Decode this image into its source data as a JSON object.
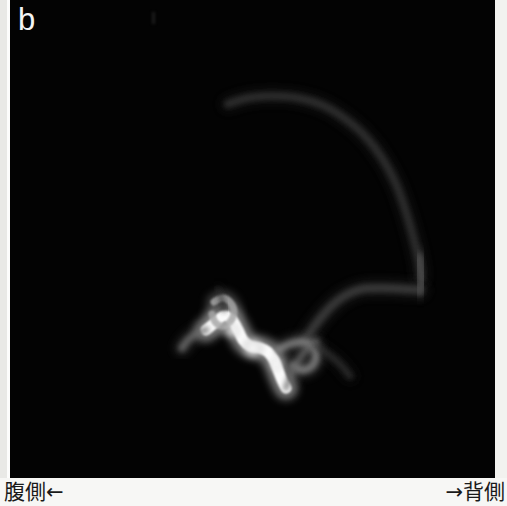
{
  "figure": {
    "panel_label": "b",
    "background_color": "#030303",
    "caption_background_color": "#f7f7f5"
  },
  "caption": {
    "left_label": "腹側←",
    "right_label": "→背側"
  },
  "chart_data": {
    "type": "scatter",
    "title": "b",
    "subtitle": "",
    "xlabel": "腹側← → 背側",
    "ylabel": "",
    "legend_position": "none",
    "grid": false,
    "modality": "MR angiography maximum intensity projection",
    "orientation": {
      "left_direction_label": "腹側←",
      "left_direction_meaning": "ventral",
      "right_direction_label": "→背側",
      "right_direction_meaning": "dorsal"
    },
    "xlim": [
      0,
      485
    ],
    "ylim": [
      0,
      478
    ],
    "annotations": [
      {
        "text": "b",
        "x": 18,
        "y": 22,
        "color": "#f4f4f4"
      }
    ],
    "series": [
      {
        "name": "cortical-arc-vessel",
        "intensity": 0.22,
        "stroke_width": 7,
        "points": [
          [
            218,
            104
          ],
          [
            238,
            98
          ],
          [
            262,
            96
          ],
          [
            288,
            98
          ],
          [
            312,
            105
          ],
          [
            334,
            118
          ],
          [
            355,
            136
          ],
          [
            372,
            158
          ],
          [
            386,
            184
          ],
          [
            396,
            212
          ],
          [
            404,
            240
          ],
          [
            409,
            262
          ],
          [
            411,
            278
          ]
        ]
      },
      {
        "name": "descending-limb-vessel",
        "intensity": 0.3,
        "stroke_width": 9,
        "points": [
          [
            409,
            258
          ],
          [
            411,
            272
          ],
          [
            412,
            282
          ],
          [
            410,
            290
          ]
        ]
      },
      {
        "name": "horizontal-basal-segment",
        "intensity": 0.26,
        "stroke_width": 8,
        "points": [
          [
            410,
            290
          ],
          [
            392,
            289
          ],
          [
            372,
            288
          ],
          [
            352,
            289
          ],
          [
            338,
            294
          ],
          [
            326,
            302
          ],
          [
            314,
            314
          ],
          [
            303,
            328
          ],
          [
            294,
            342
          ]
        ]
      },
      {
        "name": "bright-tortuous-cluster-main",
        "intensity": 0.95,
        "stroke_width": 11,
        "points": [
          [
            196,
            330
          ],
          [
            206,
            322
          ],
          [
            214,
            316
          ],
          [
            222,
            320
          ],
          [
            228,
            330
          ],
          [
            233,
            340
          ],
          [
            240,
            346
          ],
          [
            250,
            348
          ],
          [
            258,
            352
          ],
          [
            264,
            360
          ],
          [
            268,
            370
          ],
          [
            272,
            380
          ],
          [
            276,
            388
          ]
        ]
      },
      {
        "name": "upper-loop-branch",
        "intensity": 0.62,
        "stroke_width": 7,
        "points": [
          [
            204,
            302
          ],
          [
            212,
            298
          ],
          [
            220,
            302
          ],
          [
            224,
            312
          ],
          [
            220,
            322
          ],
          [
            212,
            326
          ],
          [
            205,
            322
          ],
          [
            202,
            314
          ]
        ]
      },
      {
        "name": "left-tail-branch",
        "intensity": 0.42,
        "stroke_width": 7,
        "points": [
          [
            196,
            330
          ],
          [
            186,
            334
          ],
          [
            178,
            340
          ],
          [
            172,
            348
          ]
        ]
      },
      {
        "name": "right-hook-branch",
        "intensity": 0.5,
        "stroke_width": 7,
        "points": [
          [
            268,
            350
          ],
          [
            280,
            344
          ],
          [
            292,
            342
          ],
          [
            302,
            346
          ],
          [
            306,
            356
          ],
          [
            302,
            366
          ],
          [
            292,
            370
          ],
          [
            284,
            366
          ]
        ]
      },
      {
        "name": "lower-descending-branch",
        "intensity": 0.38,
        "stroke_width": 6,
        "points": [
          [
            276,
            388
          ],
          [
            282,
            372
          ],
          [
            290,
            358
          ],
          [
            298,
            348
          ],
          [
            306,
            342
          ]
        ]
      },
      {
        "name": "faint-distal-wisp",
        "intensity": 0.2,
        "stroke_width": 6,
        "points": [
          [
            306,
            346
          ],
          [
            318,
            354
          ],
          [
            330,
            364
          ],
          [
            340,
            376
          ]
        ]
      },
      {
        "name": "faint-upper-left-wisp",
        "intensity": 0.16,
        "stroke_width": 5,
        "points": [
          [
            208,
            290
          ],
          [
            212,
            300
          ],
          [
            214,
            310
          ]
        ]
      }
    ],
    "hotspots": [
      {
        "name": "brightest-node",
        "x": 243,
        "y": 348,
        "radius": 13,
        "intensity": 1.0
      },
      {
        "name": "secondary-node",
        "x": 222,
        "y": 331,
        "radius": 10,
        "intensity": 0.82
      },
      {
        "name": "tertiary-node",
        "x": 266,
        "y": 364,
        "radius": 9,
        "intensity": 0.66
      }
    ]
  }
}
